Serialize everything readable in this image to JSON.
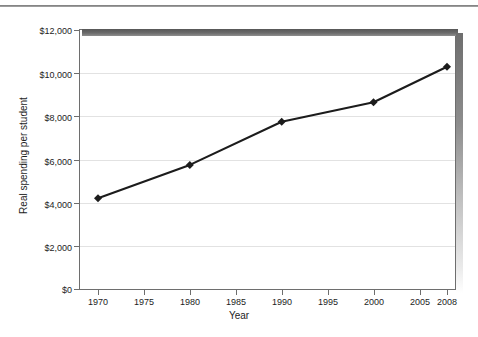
{
  "chart_data": {
    "type": "line",
    "title": "",
    "xlabel": "Year",
    "ylabel": "Real spending per student",
    "x": [
      1970,
      1980,
      1990,
      2000,
      2008
    ],
    "values": [
      4200,
      5750,
      7750,
      8650,
      10300
    ],
    "series": [
      {
        "name": "Real spending per student",
        "x": [
          1970,
          1980,
          1990,
          2000,
          2008
        ],
        "values": [
          4200,
          5750,
          7750,
          8650,
          10300
        ]
      }
    ],
    "xlim": [
      1968,
      2009
    ],
    "ylim": [
      0,
      12000
    ],
    "xticks": [
      1970,
      1975,
      1980,
      1985,
      1990,
      1995,
      2000,
      2005,
      2008
    ],
    "xtick_labels": [
      "1970",
      "1975",
      "1980",
      "1985",
      "1990",
      "1995",
      "2000",
      "2005",
      "2008"
    ],
    "yticks": [
      0,
      2000,
      4000,
      6000,
      8000,
      10000,
      12000
    ],
    "ytick_labels": [
      "$0",
      "$2,000",
      "$4,000",
      "$6,000",
      "$8,000",
      "$10,000",
      "$12,000"
    ],
    "grid": "horizontal",
    "legend": "none",
    "marker": "diamond",
    "line_color": "#1c1c1c",
    "marker_color": "#1c1c1c",
    "grid_color": "#e2e2e2",
    "axis_color": "#6e6e6e"
  },
  "axes": {
    "y_labels": [
      {
        "text": "$12,000",
        "top": 26
      },
      {
        "text": "$10,000",
        "top": 70
      },
      {
        "text": "$8,000",
        "top": 113
      },
      {
        "text": "$6,000",
        "top": 157
      },
      {
        "text": "$4,000",
        "top": 200
      },
      {
        "text": "$2,000",
        "top": 243
      },
      {
        "text": "$0",
        "top": 285
      }
    ],
    "x_labels": [
      {
        "text": "1970",
        "left": 78
      },
      {
        "text": "1975",
        "left": 124
      },
      {
        "text": "1980",
        "left": 170
      },
      {
        "text": "1985",
        "left": 216
      },
      {
        "text": "1990",
        "left": 262
      },
      {
        "text": "1995",
        "left": 308
      },
      {
        "text": "2000",
        "left": 354
      },
      {
        "text": "2005",
        "left": 400
      },
      {
        "text": "2008",
        "left": 427
      }
    ]
  }
}
